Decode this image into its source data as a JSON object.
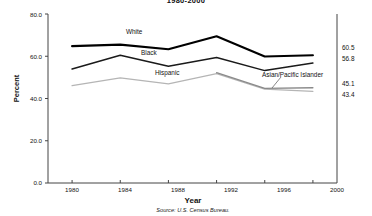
{
  "chart_data": {
    "type": "line",
    "title": "1980-2000",
    "xlabel": "Year",
    "ylabel": "Percent",
    "source": "Source: U.S. Census Bureau.",
    "x": [
      1980,
      1984,
      1988,
      1992,
      1996,
      2000
    ],
    "xtick_labels": [
      "1980",
      "1984",
      "1988",
      "1992",
      "1996",
      "2000"
    ],
    "ytick_labels": [
      "0.0",
      "20.0",
      "40.0",
      "60.0",
      "80.0"
    ],
    "yticks": [
      0,
      20,
      40,
      60,
      80
    ],
    "ylim": [
      0,
      80
    ],
    "xlim": [
      1978,
      2002
    ],
    "grid": false,
    "legend_position": "inline-labels",
    "series": [
      {
        "name": "White",
        "label": "White",
        "color": "#000000",
        "width": 2.1,
        "x": [
          1980,
          1984,
          1988,
          1992,
          1996,
          2000
        ],
        "values": [
          64.8,
          65.5,
          63.3,
          69.5,
          59.9,
          60.5
        ],
        "end_value": "60.5"
      },
      {
        "name": "Black",
        "label": "Black",
        "color": "#1a1a1a",
        "width": 1.5,
        "x": [
          1980,
          1984,
          1988,
          1992,
          1996,
          2000
        ],
        "values": [
          54.0,
          60.5,
          55.3,
          59.4,
          53.2,
          56.8
        ],
        "end_value": "56.8"
      },
      {
        "name": "Hispanic",
        "label": "Hispanic",
        "color": "#b5b5b5",
        "width": 1.3,
        "x": [
          1980,
          1984,
          1988,
          1992,
          1996,
          2000
        ],
        "values": [
          46.1,
          49.8,
          46.9,
          51.8,
          44.4,
          43.4
        ],
        "end_value": "43.4"
      },
      {
        "name": "Asian/Pacific Islander",
        "label": "Asian/Pacific Islander",
        "color": "#8a8a8a",
        "width": 1.3,
        "x": [
          1992,
          1996,
          2000
        ],
        "values": [
          52.2,
          44.8,
          45.1
        ],
        "end_value": "45.1"
      }
    ],
    "annotations": [
      {
        "text": "White",
        "series": "White"
      },
      {
        "text": "Black",
        "series": "Black"
      },
      {
        "text": "Hispanic",
        "series": "Hispanic"
      },
      {
        "text": "Asian/Pacific Islander",
        "series": "Asian/Pacific Islander"
      }
    ]
  }
}
